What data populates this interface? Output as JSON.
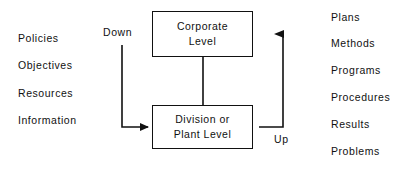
{
  "diagram": {
    "title_visible": false,
    "canvas": {
      "width": 402,
      "height": 173,
      "background": "#ffffff"
    },
    "ink_color": "#111111"
  },
  "left_column": {
    "name": "inputs-column",
    "items": [
      {
        "label": "Policies",
        "x": 18,
        "y": 33
      },
      {
        "label": "Objectives",
        "x": 18,
        "y": 60
      },
      {
        "label": "Resources",
        "x": 18,
        "y": 88
      },
      {
        "label": "Information",
        "x": 18,
        "y": 115
      }
    ]
  },
  "right_column": {
    "name": "outputs-column",
    "items": [
      {
        "label": "Plans",
        "x": 331,
        "y": 12
      },
      {
        "label": "Methods",
        "x": 331,
        "y": 38
      },
      {
        "label": "Programs",
        "x": 331,
        "y": 65
      },
      {
        "label": "Procedures",
        "x": 331,
        "y": 92
      },
      {
        "label": "Results",
        "x": 331,
        "y": 119
      },
      {
        "label": "Problems",
        "x": 331,
        "y": 146
      }
    ]
  },
  "nodes": [
    {
      "id": "corporate",
      "line1": "Corporate",
      "line2": "Level",
      "text": "Corporate\nLevel"
    },
    {
      "id": "division",
      "line1": "Division or",
      "line2": "Plant Level",
      "text": "Division or\nPlant Level"
    }
  ],
  "flow_labels": [
    {
      "id": "down",
      "label": "Down",
      "x": 103,
      "y": 27
    },
    {
      "id": "up",
      "label": "Up",
      "x": 274,
      "y": 134
    }
  ],
  "connectors": [
    {
      "id": "down-arrow",
      "from": "Down label",
      "to": "Division or Plant Level",
      "direction": "down-then-right"
    },
    {
      "id": "corporate-to-division",
      "from": "Corporate Level",
      "to": "Division or Plant Level",
      "direction": "down"
    },
    {
      "id": "up-arrow",
      "from": "Division or Plant Level",
      "to": "Corporate Level",
      "direction": "right-then-up"
    }
  ]
}
